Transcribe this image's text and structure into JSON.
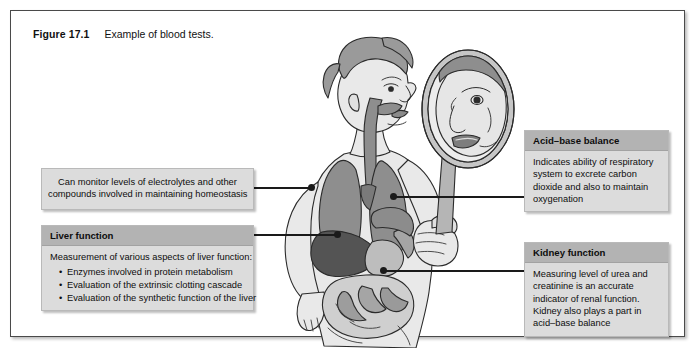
{
  "figure": {
    "label": "Figure 17.1",
    "caption": "Example of blood tests."
  },
  "callouts": [
    {
      "id": "homeostasis",
      "name": "callout-homeostasis",
      "header": null,
      "lines": [
        "Can monitor levels of electrolytes and other",
        "compounds involved in maintaining homeostasis"
      ],
      "bullets": []
    },
    {
      "id": "liver",
      "name": "callout-liver",
      "header": "Liver function",
      "lines": [
        "Measurement of various aspects of liver function:"
      ],
      "bullets": [
        "Enzymes involved in protein metabolism",
        "Evaluation of the extrinsic clotting cascade",
        "Evaluation of the synthetic function of the liver"
      ]
    },
    {
      "id": "acid_base",
      "name": "callout-acid-base",
      "header": "Acid–base balance",
      "lines": [
        "Indicates ability of respiratory",
        "system to excrete carbon",
        "dioxide and also to maintain",
        "oxygenation"
      ],
      "bullets": []
    },
    {
      "id": "kidney",
      "name": "callout-kidney",
      "header": "Kidney function",
      "lines": [
        "Measuring level of urea and",
        "creatinine is an accurate",
        "indicator of renal function.",
        "Kidney also plays a part in",
        "acid–base balance"
      ],
      "bullets": []
    }
  ],
  "illustration": {
    "name": "person-with-mirror-anatomy-illustration",
    "description": "Side view of a person holding a hand mirror, with internal organs shown",
    "parts": [
      "hand-mirror",
      "reflected-face",
      "head-profile",
      "airway-esophagus",
      "lungs",
      "liver",
      "stomach",
      "intestines",
      "arm"
    ]
  },
  "colors": {
    "frame_border": "#4a4a4a",
    "callout_body_bg": "#dcdcdc",
    "callout_header_bg": "#b3b3b3",
    "leader_line": "#1a1a1a",
    "skin": "#e8e8e8",
    "hair": "#9a9a9a",
    "lung": "#8e8e8e",
    "liver": "#5a5a5a",
    "stomach": "#c0c0c0",
    "intestine": "#a8a8a8"
  }
}
